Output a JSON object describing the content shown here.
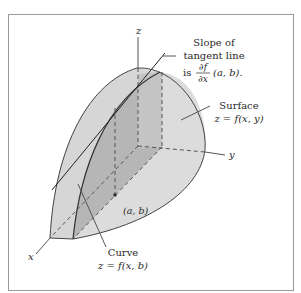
{
  "figure": {
    "type": "partial-derivative-illustration",
    "axes": {
      "x": "x",
      "y": "y",
      "z": "z"
    },
    "point_label": "(a, b)",
    "annotations": {
      "slope": {
        "line1": "Slope of",
        "line2": "tangent line",
        "line3_prefix": "is",
        "frac_num": "∂f",
        "frac_den": "∂x",
        "line3_suffix": "(a, b)."
      },
      "surface": {
        "line1": "Surface",
        "line2": "z = f(x, y)"
      },
      "curve": {
        "line1": "Curve",
        "line2": "z = f(x, b)"
      }
    },
    "colors": {
      "frame": "#9a9a9a",
      "surface_light": "#dcdcdc",
      "surface_mid": "#cfcfcf",
      "slice": "#b4b4b4",
      "outline": "#444444",
      "axis": "#555555"
    }
  }
}
